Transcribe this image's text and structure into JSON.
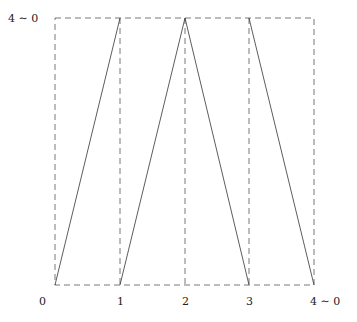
{
  "diagram": {
    "box": {
      "x1": 55,
      "y1": 18,
      "x2": 314,
      "y2": 285
    },
    "dashed_verticals_x": [
      120,
      185,
      249
    ],
    "y_label": "4 ∼ 0",
    "x_labels": [
      {
        "text": "0",
        "x": 42
      },
      {
        "text": "1",
        "x": 120
      },
      {
        "text": "2",
        "x": 185
      },
      {
        "text": "3",
        "x": 249
      },
      {
        "text": "4 ∼ 0",
        "x": 326
      }
    ],
    "segments": [
      {
        "from": [
          55,
          285
        ],
        "to": [
          120,
          18
        ]
      },
      {
        "from": [
          120,
          285
        ],
        "to": [
          185,
          18
        ]
      },
      {
        "from": [
          185,
          18
        ],
        "to": [
          249,
          285
        ]
      },
      {
        "from": [
          249,
          18
        ],
        "to": [
          314,
          285
        ]
      }
    ],
    "colors": {
      "line": "#333333",
      "dash": "#555555",
      "text": "#222222"
    }
  }
}
